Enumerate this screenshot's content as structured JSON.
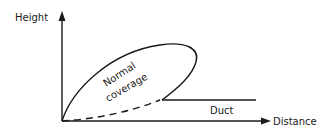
{
  "diagram": {
    "axes": {
      "y_label": "Height",
      "x_label": "Distance"
    },
    "regions": {
      "lobe_label_line1": "Normal",
      "lobe_label_line2": "coverage",
      "duct_label": "Duct"
    },
    "colors": {
      "ink": "#1a1a1a",
      "background": "#ffffff"
    }
  }
}
